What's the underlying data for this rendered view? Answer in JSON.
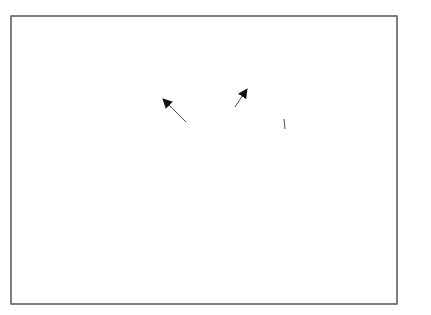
{
  "diagram": {
    "type": "mind-map",
    "center": {
      "id": "center",
      "lines": [
        "Your needs as a",
        "research student"
      ]
    },
    "nodes": [
      {
        "id": "quality",
        "lines": [
          "Quality thinking",
          "time"
        ],
        "arrow": "from-center"
      },
      {
        "id": "distraction",
        "lines": [
          "Distraction-free",
          "reading time"
        ],
        "arrow": "from-center"
      },
      {
        "id": "grasp",
        "lines": [
          "Good grasp of",
          "difficult concepts"
        ],
        "arrow": "from-center"
      },
      {
        "id": "pc",
        "lines": [
          "Good",
          "PC skills"
        ],
        "arrow": "from-center"
      },
      {
        "id": "maths",
        "lines": [
          "Maths",
          "?"
        ],
        "arrow": "to-center"
      },
      {
        "id": "statistics",
        "lines": [
          "Statistics",
          "?"
        ],
        "arrow": "to-center"
      },
      {
        "id": "combine",
        "lines": [
          "Ability to",
          "combine facts",
          "into a coherent",
          "argument"
        ],
        "arrow": "to-center"
      },
      {
        "id": "understand",
        "lines": [
          "Ability to",
          "understand",
          "alternative",
          "arguments"
        ],
        "arrow": "to-center"
      }
    ]
  },
  "text": {
    "center_l1": "Your needs as a",
    "center_l2": "research student",
    "quality_l1": "Quality thinking",
    "quality_l2": "time",
    "distraction_l1": "Distraction-free",
    "distraction_l2": "reading time",
    "grasp_l1": "Good grasp of",
    "grasp_l2": "difficult concepts",
    "pc_l1": "Good",
    "pc_l2": "PC skills",
    "maths_l1": "Maths",
    "maths_l2": "?",
    "statistics_l1": "Statistics",
    "statistics_l2": "?",
    "combine_l1": "Ability to",
    "combine_l2": "combine facts",
    "combine_l3": "into a coherent",
    "combine_l4": "argument",
    "understand_l1": "Ability to",
    "understand_l2": "understand",
    "understand_l3": "alternative",
    "understand_l4": "arguments"
  }
}
